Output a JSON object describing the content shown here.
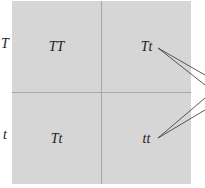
{
  "punnett_square": {
    "row_labels": [
      "T",
      "t"
    ],
    "cells": [
      [
        "TT",
        "Tt"
      ],
      [
        "Tt",
        "tt"
      ]
    ]
  },
  "colors": {
    "cell_fill": "#d6d6d6",
    "grid_line": "#a8a8a8",
    "text": "#222222"
  },
  "annotation": {
    "description": "pointer lines from Tt and tt cells leading off the right edge"
  }
}
